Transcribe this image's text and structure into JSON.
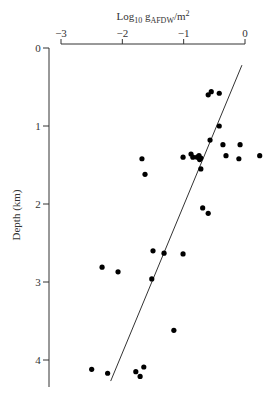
{
  "chart_data": {
    "type": "scatter",
    "title": "",
    "xlabel": "Log10 gAFDW/m2",
    "xlabel_parts": {
      "base": "Log",
      "sub1": "10",
      "mid": " g",
      "sub2": "AFDW",
      "tail": "/m",
      "sup": "2"
    },
    "ylabel": "Depth (km)",
    "x_axis_position": "top",
    "xlim": [
      -3,
      0
    ],
    "ylim": [
      0,
      4.3
    ],
    "y_inverted": true,
    "x_ticks": [
      -3,
      -2,
      -1,
      0
    ],
    "x_tick_labels": [
      "−3",
      "−2",
      "−1",
      "0"
    ],
    "y_ticks": [
      0,
      1,
      2,
      3,
      4
    ],
    "y_tick_labels": [
      "0",
      "1",
      "2",
      "3",
      "4"
    ],
    "grid": false,
    "legend": null,
    "points": [
      {
        "x": -0.6,
        "y": 0.6
      },
      {
        "x": -0.55,
        "y": 0.56
      },
      {
        "x": -0.42,
        "y": 0.58
      },
      {
        "x": -0.42,
        "y": 1.0
      },
      {
        "x": -0.57,
        "y": 1.18
      },
      {
        "x": -0.36,
        "y": 1.24
      },
      {
        "x": -0.08,
        "y": 1.24
      },
      {
        "x": -1.68,
        "y": 1.42
      },
      {
        "x": -1.01,
        "y": 1.4
      },
      {
        "x": -0.88,
        "y": 1.36
      },
      {
        "x": -0.85,
        "y": 1.4
      },
      {
        "x": -0.75,
        "y": 1.38
      },
      {
        "x": -0.72,
        "y": 1.41
      },
      {
        "x": -0.78,
        "y": 1.4
      },
      {
        "x": -0.74,
        "y": 1.43
      },
      {
        "x": -0.31,
        "y": 1.38
      },
      {
        "x": -0.1,
        "y": 1.42
      },
      {
        "x": 0.24,
        "y": 1.38
      },
      {
        "x": -1.63,
        "y": 1.62
      },
      {
        "x": -0.72,
        "y": 1.55
      },
      {
        "x": -0.69,
        "y": 2.05
      },
      {
        "x": -0.6,
        "y": 2.12
      },
      {
        "x": -1.5,
        "y": 2.6
      },
      {
        "x": -1.32,
        "y": 2.63
      },
      {
        "x": -1.01,
        "y": 2.64
      },
      {
        "x": -2.33,
        "y": 2.81
      },
      {
        "x": -2.07,
        "y": 2.87
      },
      {
        "x": -1.52,
        "y": 2.96
      },
      {
        "x": -1.16,
        "y": 3.62
      },
      {
        "x": -2.5,
        "y": 4.12
      },
      {
        "x": -2.24,
        "y": 4.17
      },
      {
        "x": -1.78,
        "y": 4.15
      },
      {
        "x": -1.71,
        "y": 4.21
      },
      {
        "x": -1.65,
        "y": 4.09
      }
    ],
    "regression_line": {
      "x1": -0.05,
      "y1": 0.22,
      "x2": -2.19,
      "y2": 4.27
    },
    "colors": {
      "points": "#000000",
      "line": "#333333",
      "axes": "#333333"
    }
  }
}
